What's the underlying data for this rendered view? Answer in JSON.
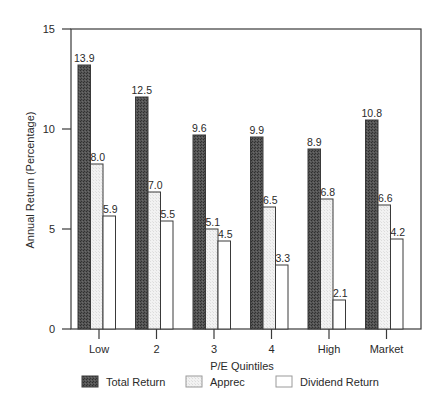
{
  "chart_data": {
    "type": "bar",
    "title": "",
    "xlabel": "P/E Quintiles",
    "ylabel": "Annual Return (Percentage)",
    "ylim": [
      0,
      15
    ],
    "yticks": [
      0,
      5,
      10,
      15
    ],
    "grid": false,
    "legend_position": "bottom",
    "categories": [
      "Low",
      "2",
      "3",
      "4",
      "High",
      "Market"
    ],
    "series": [
      {
        "name": "Total Return",
        "values": [
          13.9,
          12.5,
          9.6,
          9.9,
          8.9,
          10.8
        ],
        "drawn_heights": [
          13.2,
          11.6,
          9.7,
          9.6,
          9.0,
          10.45
        ],
        "fill": "#4a4a4a",
        "pattern": "dark"
      },
      {
        "name": "Apprec",
        "values": [
          8.0,
          7.0,
          5.1,
          6.5,
          6.8,
          6.6
        ],
        "drawn_heights": [
          8.25,
          6.85,
          5.0,
          6.1,
          6.5,
          6.2
        ],
        "fill": "#eeeeee",
        "pattern": "light"
      },
      {
        "name": "Dividend Return",
        "values": [
          5.9,
          5.5,
          4.5,
          3.3,
          2.1,
          4.2
        ],
        "drawn_heights": [
          5.65,
          5.4,
          4.4,
          3.2,
          1.45,
          4.5
        ],
        "fill": "#ffffff",
        "pattern": "none"
      }
    ]
  }
}
